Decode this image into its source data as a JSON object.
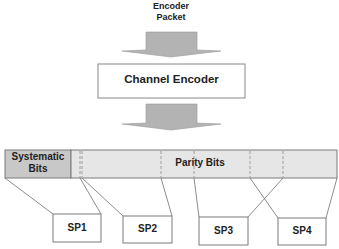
{
  "input": {
    "line1": "Encoder",
    "line2": "Packet"
  },
  "encoder": {
    "label": "Channel Encoder"
  },
  "codeword": {
    "systematic": {
      "line1": "Systematic",
      "line2": "Bits"
    },
    "parity": {
      "label": "Parity Bits"
    }
  },
  "subpackets": [
    {
      "label": "SP1"
    },
    {
      "label": "SP2"
    },
    {
      "label": "SP3"
    },
    {
      "label": "SP4"
    }
  ],
  "colors": {
    "arrow_fill": "#b3b3b3",
    "systematic_fill": "#c8c8c8",
    "parity_fill": "#e6e6e6",
    "stroke": "#7a7a7a"
  }
}
